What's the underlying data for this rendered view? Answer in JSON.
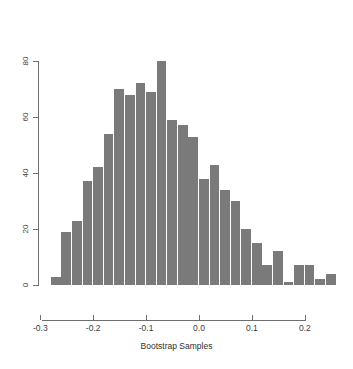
{
  "chart_data": {
    "type": "bar",
    "title": "",
    "subtitle": "",
    "xlabel": "Bootstrap Samples",
    "ylabel": "",
    "grid": false,
    "legend": null,
    "xlim": [
      -0.3,
      0.25
    ],
    "ylim": [
      0,
      80
    ],
    "bin_width": 0.02,
    "xticks": [
      -0.3,
      -0.2,
      -0.1,
      0.0,
      0.1,
      0.2
    ],
    "xticklabels": [
      "-0.3",
      "-0.2",
      "-0.1",
      "0.0",
      "0.1",
      "0.2"
    ],
    "yticks": [
      0,
      20,
      40,
      60,
      80
    ],
    "yticklabels": [
      "0",
      "20",
      "40",
      "60",
      "80"
    ],
    "bar_color": "#7a7a7a",
    "axis_color": "#6e6e6e",
    "background": "#ffffff",
    "bin_edges": [
      -0.28,
      -0.26,
      -0.24,
      -0.22,
      -0.2,
      -0.18,
      -0.16,
      -0.14,
      -0.12,
      -0.1,
      -0.08,
      -0.06,
      -0.04,
      -0.02,
      0.0,
      0.02,
      0.04,
      0.06,
      0.08,
      0.1,
      0.12,
      0.14,
      0.16,
      0.18,
      0.2,
      0.22,
      0.24,
      0.26
    ],
    "x": [
      -0.27,
      -0.25,
      -0.23,
      -0.21,
      -0.19,
      -0.17,
      -0.15,
      -0.13,
      -0.11,
      -0.09,
      -0.07,
      -0.05,
      -0.03,
      -0.01,
      0.01,
      0.03,
      0.05,
      0.07,
      0.09,
      0.11,
      0.13,
      0.15,
      0.17,
      0.19,
      0.21,
      0.23,
      0.25
    ],
    "categories": [
      "-0.27",
      "-0.25",
      "-0.23",
      "-0.21",
      "-0.19",
      "-0.17",
      "-0.15",
      "-0.13",
      "-0.11",
      "-0.09",
      "-0.07",
      "-0.05",
      "-0.03",
      "-0.01",
      "0.01",
      "0.03",
      "0.05",
      "0.07",
      "0.09",
      "0.11",
      "0.13",
      "0.15",
      "0.17",
      "0.19",
      "0.21",
      "0.23",
      "0.25"
    ],
    "values": [
      3,
      19,
      23,
      37,
      42,
      54,
      70,
      68,
      72,
      69,
      80,
      59,
      57,
      53,
      38,
      43,
      34,
      30,
      20,
      15,
      7,
      12,
      1,
      7,
      7,
      2,
      4
    ]
  }
}
